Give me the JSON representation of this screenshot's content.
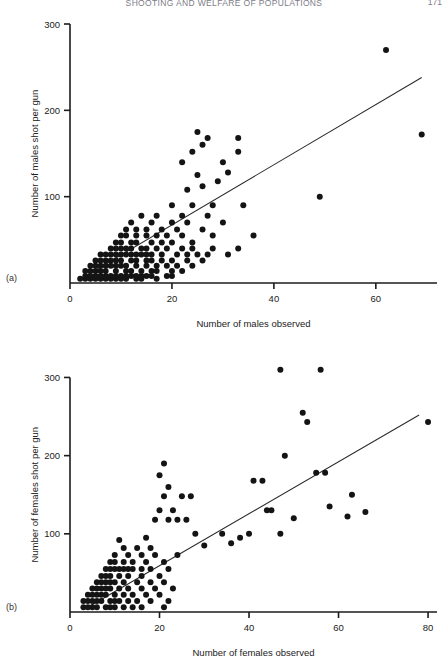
{
  "running_head": {
    "title": "SHOOTING AND WELFARE OF POPULATIONS",
    "page_number": "171"
  },
  "chart_data": [
    {
      "id": "panel-a",
      "type": "scatter",
      "panel_label": "(a)",
      "title": "",
      "xlabel": "Number of males observed",
      "ylabel": "Number of males shot per gun",
      "xlim": [
        0,
        72
      ],
      "ylim": [
        0,
        300
      ],
      "xticks": [
        0,
        20,
        40,
        60
      ],
      "yticks": [
        100,
        200,
        300
      ],
      "xtick_labels": [
        "0",
        "20",
        "40",
        "60"
      ],
      "ytick_labels": [
        "100",
        "200",
        "300"
      ],
      "grid": false,
      "legend": "none",
      "fit_line": {
        "x0": 3,
        "y0": 8,
        "x1": 69,
        "y1": 238
      },
      "points": [
        [
          2,
          5
        ],
        [
          3,
          5
        ],
        [
          4,
          5
        ],
        [
          5,
          5
        ],
        [
          6,
          5
        ],
        [
          7,
          5
        ],
        [
          8,
          5
        ],
        [
          9,
          5
        ],
        [
          10,
          5
        ],
        [
          11,
          5
        ],
        [
          13,
          5
        ],
        [
          14,
          5
        ],
        [
          17,
          5
        ],
        [
          3,
          8
        ],
        [
          4,
          8
        ],
        [
          5,
          8
        ],
        [
          6,
          8
        ],
        [
          7,
          8
        ],
        [
          8,
          8
        ],
        [
          9,
          8
        ],
        [
          10,
          8
        ],
        [
          11,
          8
        ],
        [
          12,
          8
        ],
        [
          13,
          8
        ],
        [
          14,
          8
        ],
        [
          15,
          8
        ],
        [
          16,
          8
        ],
        [
          19,
          8
        ],
        [
          20,
          8
        ],
        [
          3,
          14
        ],
        [
          4,
          14
        ],
        [
          5,
          14
        ],
        [
          6,
          14
        ],
        [
          7,
          14
        ],
        [
          9,
          14
        ],
        [
          11,
          14
        ],
        [
          12,
          14
        ],
        [
          14,
          14
        ],
        [
          16,
          14
        ],
        [
          17,
          14
        ],
        [
          20,
          14
        ],
        [
          22,
          14
        ],
        [
          4,
          20
        ],
        [
          5,
          20
        ],
        [
          6,
          20
        ],
        [
          7,
          20
        ],
        [
          8,
          20
        ],
        [
          9,
          20
        ],
        [
          10,
          20
        ],
        [
          11,
          20
        ],
        [
          13,
          20
        ],
        [
          15,
          20
        ],
        [
          17,
          20
        ],
        [
          19,
          20
        ],
        [
          21,
          20
        ],
        [
          24,
          20
        ],
        [
          5,
          26
        ],
        [
          6,
          26
        ],
        [
          7,
          26
        ],
        [
          8,
          26
        ],
        [
          9,
          26
        ],
        [
          10,
          26
        ],
        [
          12,
          26
        ],
        [
          13,
          26
        ],
        [
          15,
          26
        ],
        [
          16,
          26
        ],
        [
          18,
          26
        ],
        [
          20,
          26
        ],
        [
          23,
          26
        ],
        [
          26,
          26
        ],
        [
          6,
          33
        ],
        [
          7,
          33
        ],
        [
          8,
          33
        ],
        [
          9,
          33
        ],
        [
          10,
          33
        ],
        [
          11,
          33
        ],
        [
          12,
          33
        ],
        [
          13,
          33
        ],
        [
          14,
          33
        ],
        [
          15,
          33
        ],
        [
          16,
          33
        ],
        [
          18,
          33
        ],
        [
          21,
          33
        ],
        [
          23,
          33
        ],
        [
          25,
          33
        ],
        [
          27,
          33
        ],
        [
          31,
          33
        ],
        [
          8,
          40
        ],
        [
          9,
          40
        ],
        [
          10,
          40
        ],
        [
          11,
          40
        ],
        [
          12,
          40
        ],
        [
          14,
          40
        ],
        [
          15,
          40
        ],
        [
          17,
          40
        ],
        [
          19,
          40
        ],
        [
          22,
          40
        ],
        [
          24,
          40
        ],
        [
          28,
          40
        ],
        [
          33,
          40
        ],
        [
          9,
          47
        ],
        [
          10,
          47
        ],
        [
          12,
          47
        ],
        [
          13,
          47
        ],
        [
          16,
          47
        ],
        [
          18,
          47
        ],
        [
          20,
          47
        ],
        [
          24,
          47
        ],
        [
          10,
          55
        ],
        [
          11,
          55
        ],
        [
          13,
          55
        ],
        [
          15,
          55
        ],
        [
          17,
          55
        ],
        [
          19,
          55
        ],
        [
          22,
          55
        ],
        [
          28,
          55
        ],
        [
          36,
          55
        ],
        [
          11,
          62
        ],
        [
          13,
          62
        ],
        [
          15,
          62
        ],
        [
          18,
          62
        ],
        [
          21,
          62
        ],
        [
          26,
          62
        ],
        [
          12,
          70
        ],
        [
          16,
          70
        ],
        [
          20,
          70
        ],
        [
          23,
          70
        ],
        [
          30,
          70
        ],
        [
          14,
          78
        ],
        [
          17,
          78
        ],
        [
          22,
          78
        ],
        [
          27,
          78
        ],
        [
          20,
          90
        ],
        [
          24,
          90
        ],
        [
          28,
          90
        ],
        [
          34,
          90
        ],
        [
          49,
          100
        ],
        [
          23,
          108
        ],
        [
          26,
          112
        ],
        [
          29,
          118
        ],
        [
          25,
          125
        ],
        [
          31,
          128
        ],
        [
          22,
          140
        ],
        [
          30,
          140
        ],
        [
          24,
          152
        ],
        [
          33,
          152
        ],
        [
          26,
          160
        ],
        [
          27,
          168
        ],
        [
          33,
          168
        ],
        [
          25,
          175
        ],
        [
          62,
          270
        ],
        [
          69,
          172
        ]
      ]
    },
    {
      "id": "panel-b",
      "type": "scatter",
      "panel_label": "(b)",
      "title": "",
      "xlabel": "Number of females observed",
      "ylabel": "Number of females shot per gun",
      "xlim": [
        0,
        82
      ],
      "ylim": [
        0,
        330
      ],
      "xticks": [
        0,
        20,
        40,
        60,
        80
      ],
      "yticks": [
        100,
        200,
        300
      ],
      "xtick_labels": [
        "0",
        "20",
        "40",
        "60",
        "80"
      ],
      "ytick_labels": [
        "100",
        "200",
        "300"
      ],
      "grid": false,
      "legend": "none",
      "fit_line": {
        "x0": 4,
        "y0": 6,
        "x1": 78,
        "y1": 252
      },
      "points": [
        [
          3,
          6
        ],
        [
          4,
          6
        ],
        [
          5,
          6
        ],
        [
          6,
          6
        ],
        [
          8,
          6
        ],
        [
          9,
          6
        ],
        [
          10,
          6
        ],
        [
          12,
          6
        ],
        [
          14,
          6
        ],
        [
          16,
          6
        ],
        [
          21,
          6
        ],
        [
          3,
          14
        ],
        [
          4,
          14
        ],
        [
          5,
          14
        ],
        [
          6,
          14
        ],
        [
          7,
          14
        ],
        [
          9,
          14
        ],
        [
          10,
          14
        ],
        [
          11,
          14
        ],
        [
          13,
          14
        ],
        [
          15,
          14
        ],
        [
          18,
          14
        ],
        [
          22,
          14
        ],
        [
          4,
          22
        ],
        [
          5,
          22
        ],
        [
          6,
          22
        ],
        [
          7,
          22
        ],
        [
          8,
          22
        ],
        [
          10,
          22
        ],
        [
          12,
          22
        ],
        [
          14,
          22
        ],
        [
          17,
          22
        ],
        [
          20,
          22
        ],
        [
          5,
          30
        ],
        [
          6,
          30
        ],
        [
          7,
          30
        ],
        [
          8,
          30
        ],
        [
          9,
          30
        ],
        [
          11,
          30
        ],
        [
          13,
          30
        ],
        [
          16,
          30
        ],
        [
          19,
          30
        ],
        [
          23,
          30
        ],
        [
          6,
          38
        ],
        [
          7,
          38
        ],
        [
          8,
          38
        ],
        [
          9,
          38
        ],
        [
          10,
          38
        ],
        [
          12,
          38
        ],
        [
          15,
          38
        ],
        [
          18,
          38
        ],
        [
          21,
          38
        ],
        [
          7,
          46
        ],
        [
          8,
          46
        ],
        [
          9,
          46
        ],
        [
          11,
          46
        ],
        [
          13,
          46
        ],
        [
          16,
          46
        ],
        [
          20,
          46
        ],
        [
          8,
          55
        ],
        [
          9,
          55
        ],
        [
          10,
          55
        ],
        [
          11,
          55
        ],
        [
          12,
          55
        ],
        [
          13,
          55
        ],
        [
          14,
          55
        ],
        [
          16,
          55
        ],
        [
          18,
          55
        ],
        [
          22,
          55
        ],
        [
          9,
          64
        ],
        [
          10,
          64
        ],
        [
          12,
          64
        ],
        [
          14,
          64
        ],
        [
          17,
          64
        ],
        [
          21,
          64
        ],
        [
          10,
          73
        ],
        [
          13,
          73
        ],
        [
          16,
          73
        ],
        [
          19,
          73
        ],
        [
          24,
          73
        ],
        [
          12,
          82
        ],
        [
          15,
          82
        ],
        [
          18,
          82
        ],
        [
          11,
          92
        ],
        [
          17,
          95
        ],
        [
          28,
          100
        ],
        [
          34,
          100
        ],
        [
          40,
          100
        ],
        [
          47,
          100
        ],
        [
          62,
          122
        ],
        [
          19,
          118
        ],
        [
          22,
          118
        ],
        [
          24,
          118
        ],
        [
          26,
          118
        ],
        [
          20,
          130
        ],
        [
          23,
          130
        ],
        [
          44,
          130
        ],
        [
          45,
          130
        ],
        [
          63,
          150
        ],
        [
          21,
          148
        ],
        [
          25,
          148
        ],
        [
          27,
          148
        ],
        [
          22,
          160
        ],
        [
          41,
          168
        ],
        [
          43,
          168
        ],
        [
          20,
          175
        ],
        [
          55,
          178
        ],
        [
          57,
          178
        ],
        [
          21,
          190
        ],
        [
          48,
          200
        ],
        [
          52,
          255
        ],
        [
          53,
          243
        ],
        [
          47,
          310
        ],
        [
          56,
          310
        ],
        [
          80,
          243
        ],
        [
          30,
          85
        ],
        [
          36,
          88
        ],
        [
          38,
          95
        ],
        [
          50,
          120
        ],
        [
          58,
          135
        ],
        [
          66,
          128
        ]
      ]
    }
  ]
}
